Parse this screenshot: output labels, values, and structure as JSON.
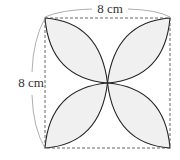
{
  "diagram": {
    "type": "geometry",
    "labels": {
      "top_dimension": "8 cm",
      "left_dimension": "8 cm"
    },
    "colors": {
      "petal_fill": "#f0f0f0",
      "arc_stroke": "#222222",
      "square_stroke": "#555555",
      "dimension_stroke": "#999999"
    }
  }
}
